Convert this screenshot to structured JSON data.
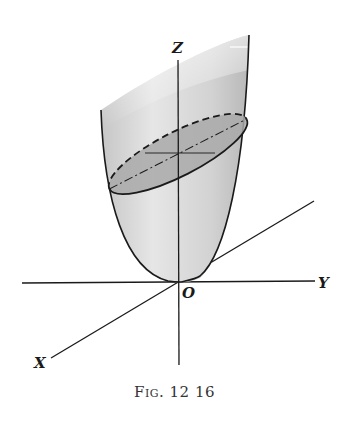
{
  "figure": {
    "caption_prefix": "Fig.",
    "caption_number": "12 16",
    "labels": {
      "z_axis": "Z",
      "y_axis": "Y",
      "x_axis": "X",
      "origin": "O"
    },
    "colors": {
      "surface_fill": "#d8d8d8",
      "section_fill": "#a9a9a9",
      "line": "#1a1a1a",
      "background": "#ffffff"
    }
  }
}
